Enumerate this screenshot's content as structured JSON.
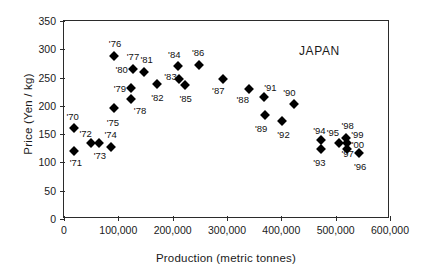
{
  "chart_data": {
    "type": "scatter",
    "title": "",
    "annotation": "JAPAN",
    "xlabel": "Production (metric tonnes)",
    "ylabel": "Price (Yen / kg)",
    "xlim": [
      0,
      600000
    ],
    "ylim": [
      0,
      350
    ],
    "xticks": [
      0,
      100000,
      200000,
      300000,
      400000,
      500000,
      600000
    ],
    "xticklabels": [
      "0",
      "100,000",
      "200,000",
      "300,000",
      "400,000",
      "500,000",
      "600,000"
    ],
    "yticks": [
      0,
      50,
      100,
      150,
      200,
      250,
      300,
      350
    ],
    "yticklabels": [
      "0",
      "50",
      "100",
      "150",
      "200",
      "250",
      "300",
      "350"
    ],
    "grid": false,
    "legend": false,
    "marker": "diamond",
    "marker_color": "#000000",
    "points": [
      {
        "label": "'70",
        "x": 18000,
        "y": 160,
        "lx": 16000,
        "ly": 182
      },
      {
        "label": "'71",
        "x": 18000,
        "y": 120,
        "lx": 22000,
        "ly": 100
      },
      {
        "label": "'72",
        "x": 50000,
        "y": 135,
        "lx": 40000,
        "ly": 152
      },
      {
        "label": "'73",
        "x": 64000,
        "y": 135,
        "lx": 66000,
        "ly": 113
      },
      {
        "label": "'74",
        "x": 86000,
        "y": 128,
        "lx": 86000,
        "ly": 150
      },
      {
        "label": "'75",
        "x": 92000,
        "y": 196,
        "lx": 90000,
        "ly": 172
      },
      {
        "label": "'76",
        "x": 92000,
        "y": 288,
        "lx": 94000,
        "ly": 311
      },
      {
        "label": "'77",
        "x": 127000,
        "y": 265,
        "lx": 127000,
        "ly": 288
      },
      {
        "label": "'78",
        "x": 123000,
        "y": 212,
        "lx": 140000,
        "ly": 192
      },
      {
        "label": "'79",
        "x": 123000,
        "y": 232,
        "lx": 103000,
        "ly": 232
      },
      {
        "label": "'80",
        "x": 127000,
        "y": 265,
        "lx": 106000,
        "ly": 266
      },
      {
        "label": "'81",
        "x": 147000,
        "y": 260,
        "lx": 152000,
        "ly": 282
      },
      {
        "label": "'82",
        "x": 171000,
        "y": 238,
        "lx": 172000,
        "ly": 216
      },
      {
        "label": "'83",
        "x": 212000,
        "y": 248,
        "lx": 196000,
        "ly": 253
      },
      {
        "label": "'84",
        "x": 210000,
        "y": 271,
        "lx": 203000,
        "ly": 292
      },
      {
        "label": "'85",
        "x": 223000,
        "y": 236,
        "lx": 224000,
        "ly": 214
      },
      {
        "label": "'86",
        "x": 248000,
        "y": 273,
        "lx": 247000,
        "ly": 296
      },
      {
        "label": "'87",
        "x": 293000,
        "y": 248,
        "lx": 284000,
        "ly": 228
      },
      {
        "label": "'88",
        "x": 340000,
        "y": 230,
        "lx": 329000,
        "ly": 212
      },
      {
        "label": "'89",
        "x": 370000,
        "y": 184,
        "lx": 363000,
        "ly": 160
      },
      {
        "label": "'90",
        "x": 423000,
        "y": 203,
        "lx": 415000,
        "ly": 224
      },
      {
        "label": "'91",
        "x": 368000,
        "y": 215,
        "lx": 380000,
        "ly": 234
      },
      {
        "label": "'92",
        "x": 401000,
        "y": 173,
        "lx": 404000,
        "ly": 150
      },
      {
        "label": "'93",
        "x": 473000,
        "y": 123,
        "lx": 470000,
        "ly": 100
      },
      {
        "label": "'94",
        "x": 473000,
        "y": 139,
        "lx": 470000,
        "ly": 157
      },
      {
        "label": "'95",
        "x": 506000,
        "y": 135,
        "lx": 495000,
        "ly": 153
      },
      {
        "label": "'96",
        "x": 543000,
        "y": 116,
        "lx": 545000,
        "ly": 93
      },
      {
        "label": "'97",
        "x": 543000,
        "y": 116,
        "lx": 522000,
        "ly": 116
      },
      {
        "label": "'98",
        "x": 519000,
        "y": 144,
        "lx": 522000,
        "ly": 166
      },
      {
        "label": "'99",
        "x": 521000,
        "y": 134,
        "lx": 540000,
        "ly": 150
      },
      {
        "label": "'00",
        "x": 521000,
        "y": 123,
        "lx": 541000,
        "ly": 133
      }
    ]
  }
}
